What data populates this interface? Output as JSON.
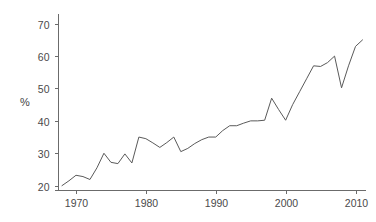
{
  "chart_data": {
    "type": "line",
    "title": "",
    "subtitle": "",
    "xlabel": "",
    "ylabel": "%",
    "xlim": [
      1967.5,
      2011.5
    ],
    "ylim": [
      18.5,
      73
    ],
    "grid": false,
    "legend": null,
    "x_ticks": [
      1970,
      1980,
      1990,
      2000,
      2010
    ],
    "x_tick_labels": [
      "1970",
      "1980",
      "1990",
      "2000",
      "2010"
    ],
    "y_ticks": [
      20,
      30,
      40,
      50,
      60,
      70
    ],
    "y_tick_labels": [
      "20",
      "30",
      "40",
      "50",
      "60",
      "70"
    ],
    "series": [
      {
        "name": "percent",
        "color": "#5a5a5a",
        "x": [
          1968,
          1969,
          1970,
          1971,
          1972,
          1973,
          1974,
          1975,
          1976,
          1977,
          1978,
          1979,
          1980,
          1981,
          1982,
          1983,
          1984,
          1985,
          1986,
          1987,
          1988,
          1989,
          1990,
          1991,
          1992,
          1993,
          1994,
          1995,
          1996,
          1997,
          1998,
          1999,
          2000,
          2001,
          2002,
          2003,
          2004,
          2005,
          2006,
          2007,
          2008,
          2009,
          2010,
          2011
        ],
        "values": [
          20.0,
          21.5,
          23.2,
          22.8,
          21.9,
          25.5,
          30.0,
          27.2,
          26.8,
          29.8,
          27.0,
          35.0,
          34.5,
          33.2,
          31.8,
          33.3,
          35.0,
          30.5,
          31.5,
          33.0,
          34.2,
          35.0,
          35.0,
          37.0,
          38.5,
          38.5,
          39.3,
          40.0,
          40.0,
          40.2,
          47.0,
          43.5,
          40.2,
          45.0,
          49.0,
          53.0,
          57.0,
          56.8,
          58.0,
          60.0,
          50.2,
          57.0,
          63.0,
          65.0
        ]
      }
    ]
  },
  "axes": {
    "y_axis_title": "%"
  }
}
